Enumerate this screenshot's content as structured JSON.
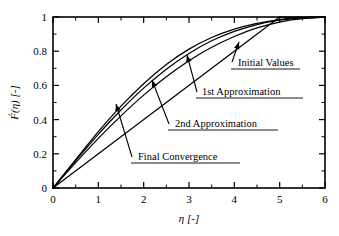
{
  "figure": {
    "background": "#ffffff",
    "line_color": "#000000",
    "frame": {
      "left": 53,
      "right": 325,
      "top": 17,
      "bottom": 188
    }
  },
  "chart_data": {
    "type": "line",
    "title": "",
    "subtitle": "",
    "xlabel": "η  [-]",
    "ylabel": "F́(η)  [-]",
    "xlim": [
      0,
      6
    ],
    "ylim": [
      0,
      1
    ],
    "xticks": [
      0,
      1,
      2,
      3,
      4,
      5,
      6
    ],
    "xticklabels": [
      "0",
      "1",
      "2",
      "3",
      "4",
      "5",
      "6"
    ],
    "yticks": [
      0,
      0.2,
      0.4,
      0.6,
      0.8,
      1
    ],
    "yticklabels": [
      "0",
      "0.2",
      "0.4",
      "0.6",
      "0.8",
      "1"
    ],
    "minor_xticks": [
      0.5,
      1.5,
      2.5,
      3.5,
      4.5,
      5.5
    ],
    "minor_yticks": [
      0.1,
      0.3,
      0.5,
      0.7,
      0.9
    ],
    "grid": false,
    "legend_position": "none",
    "series": [
      {
        "name": "Initial Values",
        "style": "straight-line",
        "x": [
          0,
          5,
          6
        ],
        "values": [
          0,
          1,
          1
        ]
      },
      {
        "name": "1st Approximation",
        "style": "curve",
        "x": [
          0,
          0.5,
          1,
          1.5,
          2,
          2.5,
          3,
          3.5,
          4,
          4.5,
          5,
          5.5,
          6
        ],
        "values": [
          0,
          0.148,
          0.29,
          0.422,
          0.543,
          0.65,
          0.744,
          0.823,
          0.886,
          0.936,
          0.97,
          0.99,
          1.0
        ]
      },
      {
        "name": "2nd Approximation",
        "style": "curve",
        "x": [
          0,
          0.5,
          1,
          1.5,
          2,
          2.5,
          3,
          3.5,
          4,
          4.5,
          5,
          5.5,
          6
        ],
        "values": [
          0,
          0.16,
          0.314,
          0.456,
          0.584,
          0.695,
          0.787,
          0.861,
          0.916,
          0.956,
          0.981,
          0.995,
          1.0
        ]
      },
      {
        "name": "Final Convergence",
        "style": "curve",
        "x": [
          0,
          0.5,
          1,
          1.5,
          2,
          2.5,
          3,
          3.5,
          4,
          4.5,
          5,
          5.5,
          6
        ],
        "values": [
          0,
          0.166,
          0.33,
          0.479,
          0.61,
          0.722,
          0.812,
          0.88,
          0.929,
          0.963,
          0.985,
          0.996,
          1.0
        ]
      }
    ],
    "annotations": [
      {
        "label": "Initial Values",
        "text_x": 238,
        "text_y": 66,
        "underline_x1": 231,
        "underline_x2": 300,
        "underline_y": 69,
        "arrow_from_x": 232,
        "arrow_from_y": 62,
        "arrow_to_x": 239,
        "arrow_to_y": 42
      },
      {
        "label": "1st Approximation",
        "text_x": 202,
        "text_y": 95,
        "underline_x1": 196,
        "underline_x2": 303,
        "underline_y": 98,
        "arrow_from_x": 197,
        "arrow_from_y": 92,
        "arrow_to_x": 187,
        "arrow_to_y": 55
      },
      {
        "label": "2nd Approximation",
        "text_x": 175,
        "text_y": 127,
        "underline_x1": 168,
        "underline_x2": 278,
        "underline_y": 130,
        "arrow_from_x": 169,
        "arrow_from_y": 124,
        "arrow_to_x": 152,
        "arrow_to_y": 80
      },
      {
        "label": "Final Convergence",
        "text_x": 138,
        "text_y": 160,
        "underline_x1": 131,
        "underline_x2": 240,
        "underline_y": 163,
        "arrow_from_x": 132,
        "arrow_from_y": 157,
        "arrow_to_x": 116,
        "arrow_to_y": 104
      }
    ]
  }
}
